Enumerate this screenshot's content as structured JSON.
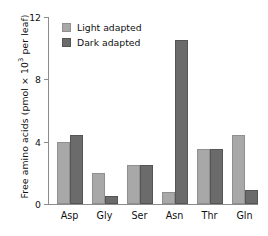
{
  "chart_data": {
    "type": "bar",
    "title": "",
    "xlabel": "",
    "ylabel": "Free amino acids (pmol × 10³ per leaf)",
    "ylabel_parts": {
      "prefix": "Free amino acids (pmol × 10",
      "exponent": "3",
      "suffix": " per leaf)"
    },
    "categories": [
      "Asp",
      "Gly",
      "Ser",
      "Asn",
      "Thr",
      "Gln"
    ],
    "series": [
      {
        "name": "Light adapted",
        "color": "#a8a8a8",
        "border_color": "#8f8f8f",
        "values": [
          4.0,
          2.0,
          2.5,
          0.8,
          3.5,
          4.4
        ]
      },
      {
        "name": "Dark adapted",
        "color": "#6b6b6b",
        "border_color": "#555555",
        "values": [
          4.4,
          0.5,
          2.5,
          10.5,
          3.5,
          0.9
        ]
      }
    ],
    "ylim": [
      0,
      12
    ],
    "yticks": [
      0,
      4,
      8,
      12
    ],
    "ytick_labels": [
      "0",
      "4",
      "8",
      "12"
    ],
    "grid": false,
    "legend_position": "top-left",
    "axis_color": "#8c8c8c",
    "background_color": "#ffffff"
  },
  "legend": {
    "items": [
      {
        "label": "Light adapted",
        "variant": "light"
      },
      {
        "label": "Dark adapted",
        "variant": "dark"
      }
    ]
  }
}
